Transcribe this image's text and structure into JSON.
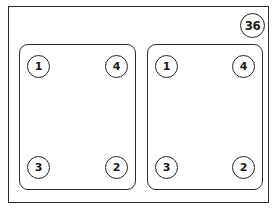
{
  "figure": {
    "badge_label": "36",
    "panels": [
      {
        "name": "left",
        "bolts": {
          "top_left": "1",
          "top_right": "4",
          "bottom_left": "3",
          "bottom_right": "2"
        }
      },
      {
        "name": "right",
        "bolts": {
          "top_left": "1",
          "top_right": "4",
          "bottom_left": "3",
          "bottom_right": "2"
        }
      }
    ]
  }
}
